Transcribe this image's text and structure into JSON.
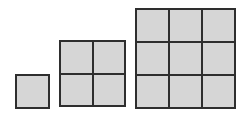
{
  "diagram": {
    "type": "square-number-sequence",
    "colors": {
      "fill": "#d6d6d6",
      "border": "#2e2e2e",
      "background": "#ffffff"
    },
    "figures": [
      {
        "id": "figure-1x1",
        "rows": 1,
        "cols": 1,
        "cells": 1,
        "x": 15,
        "y": 74,
        "size": 35
      },
      {
        "id": "figure-2x2",
        "rows": 2,
        "cols": 2,
        "cells": 4,
        "x": 59,
        "y": 40,
        "size": 67
      },
      {
        "id": "figure-3x3",
        "rows": 3,
        "cols": 3,
        "cells": 9,
        "x": 135,
        "y": 8,
        "size": 101
      }
    ]
  }
}
